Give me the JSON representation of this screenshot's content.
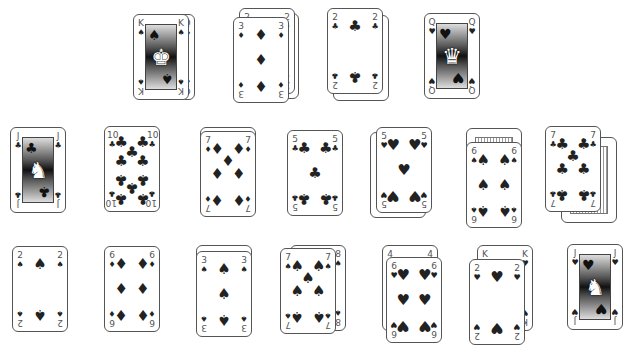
{
  "game": {
    "type": "solitaire-layout",
    "suits": {
      "spades": "♠",
      "clubs": "♣",
      "hearts": "♥",
      "diamonds": "♦"
    },
    "rows": [
      {
        "row": 1,
        "piles": [
          {
            "id": "r1p1",
            "top": {
              "rank": "K",
              "suit": "spades"
            },
            "under": [
              {
                "rank": "Q",
                "suit": "clubs"
              }
            ]
          },
          {
            "id": "r1p2",
            "top": {
              "rank": "3",
              "suit": "diamonds"
            },
            "under": [
              {
                "rank": "2",
                "suit": "diamonds"
              },
              {
                "rank": "?",
                "suit": "diamonds"
              }
            ]
          },
          {
            "id": "r1p3",
            "top": {
              "rank": "2",
              "suit": "clubs"
            },
            "under": [
              {
                "rank": "?",
                "suit": "clubs"
              }
            ]
          },
          {
            "id": "r1p4",
            "top": {
              "rank": "Q",
              "suit": "hearts"
            },
            "under": []
          }
        ]
      },
      {
        "row": 2,
        "piles": [
          {
            "id": "r2p1",
            "top": {
              "rank": "J",
              "suit": "clubs"
            },
            "under": []
          },
          {
            "id": "r2p2",
            "top": {
              "rank": "10",
              "suit": "clubs"
            },
            "under": []
          },
          {
            "id": "r2p3",
            "top": {
              "rank": "7",
              "suit": "diamonds"
            },
            "under": [
              {
                "rank": "?",
                "suit": "diamonds"
              }
            ]
          },
          {
            "id": "r2p4",
            "top": {
              "rank": "5",
              "suit": "clubs"
            },
            "under": []
          },
          {
            "id": "r2p5",
            "top": {
              "rank": "5",
              "suit": "hearts"
            },
            "under": [
              {
                "rank": "?",
                "suit": "hearts"
              }
            ]
          },
          {
            "id": "r2p6",
            "top": {
              "rank": "6",
              "suit": "spades"
            },
            "under": [
              {
                "rank": "back",
                "suit": ""
              }
            ]
          },
          {
            "id": "r2p7",
            "top": {
              "rank": "7",
              "suit": "clubs"
            },
            "under": [
              {
                "rank": "back",
                "suit": ""
              }
            ]
          }
        ]
      },
      {
        "row": 3,
        "piles": [
          {
            "id": "r3p1",
            "top": {
              "rank": "2",
              "suit": "spades"
            },
            "under": []
          },
          {
            "id": "r3p2",
            "top": {
              "rank": "6",
              "suit": "diamonds"
            },
            "under": []
          },
          {
            "id": "r3p3",
            "top": {
              "rank": "3",
              "suit": "spades"
            },
            "under": [
              {
                "rank": "?",
                "suit": "spades"
              }
            ]
          },
          {
            "id": "r3p4",
            "top": {
              "rank": "7",
              "suit": "spades"
            },
            "under": [
              {
                "rank": "8",
                "suit": "spades"
              }
            ]
          },
          {
            "id": "r3p5",
            "top": {
              "rank": "6",
              "suit": "hearts"
            },
            "under": [
              {
                "rank": "4",
                "suit": "hearts"
              }
            ]
          },
          {
            "id": "r3p6",
            "top": {
              "rank": "2",
              "suit": "hearts"
            },
            "under": [
              {
                "rank": "K",
                "suit": "hearts"
              }
            ]
          },
          {
            "id": "r3p7",
            "top": {
              "rank": "J",
              "suit": "hearts"
            },
            "under": []
          }
        ]
      }
    ]
  },
  "labels": {
    "K": "K",
    "Q": "Q",
    "J": "J",
    "10": "10",
    "8": "8",
    "7": "7",
    "6": "6",
    "5": "5",
    "4": "4",
    "3": "3",
    "2": "2"
  }
}
